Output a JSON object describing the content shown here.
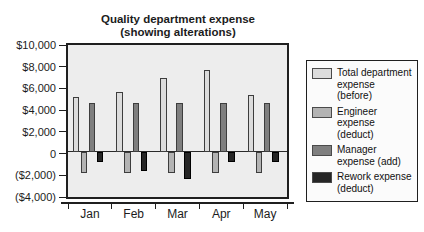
{
  "title": {
    "line1": "Quality department expense",
    "line2": "(showing alterations)"
  },
  "chart_data": {
    "type": "bar",
    "title": "Quality department expense (showing alterations)",
    "categories": [
      "Jan",
      "Feb",
      "Mar",
      "Apr",
      "May"
    ],
    "series": [
      {
        "name": "Total department expense (before)",
        "color": "#dcdcdc",
        "values": [
          5000,
          5500,
          6800,
          7500,
          5200
        ]
      },
      {
        "name": "Engineer expense (deduct)",
        "color": "#b3b3b3",
        "values": [
          -2000,
          -2000,
          -2000,
          -2000,
          -2000
        ]
      },
      {
        "name": "Manager expense (add)",
        "color": "#7f7f7f",
        "values": [
          4500,
          4500,
          4500,
          4500,
          4500
        ]
      },
      {
        "name": "Rework expense (deduct)",
        "color": "#262626",
        "values": [
          -1000,
          -1800,
          -2500,
          -1000,
          -1000
        ]
      }
    ],
    "ylim": [
      -4000,
      10000
    ],
    "y_ticks": [
      {
        "value": 10000,
        "label": "$10,000"
      },
      {
        "value": 8000,
        "label": "$8,000"
      },
      {
        "value": 6000,
        "label": "$6,000"
      },
      {
        "value": 4000,
        "label": "$4,000"
      },
      {
        "value": 2000,
        "label": "$2,000"
      },
      {
        "value": 0,
        "label": "0"
      },
      {
        "value": -2000,
        "label": "($2,000)"
      },
      {
        "value": -4000,
        "label": "($4,000)"
      }
    ],
    "xlabel": "",
    "ylabel": "",
    "grid": false,
    "legend_position": "right",
    "plot_background": "#ededed",
    "bar_border_color": "#3d3d3d"
  }
}
